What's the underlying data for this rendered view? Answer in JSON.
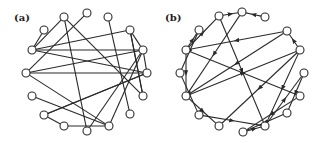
{
  "figure": {
    "panels": [
      {
        "id": "a",
        "label": "(a)",
        "label_pos": [
          14,
          21
        ],
        "directed": false,
        "node_radius": 4,
        "nodes": [
          [
            64,
            17
          ],
          [
            87,
            13
          ],
          [
            108,
            17
          ],
          [
            44,
            30
          ],
          [
            130,
            30
          ],
          [
            32,
            50
          ],
          [
            143,
            50
          ],
          [
            26,
            73
          ],
          [
            147,
            73
          ],
          [
            32,
            96
          ],
          [
            143,
            96
          ],
          [
            44,
            115
          ],
          [
            130,
            114
          ],
          [
            64,
            126
          ],
          [
            87,
            131
          ],
          [
            109,
            126
          ]
        ],
        "edges": [
          [
            0,
            5
          ],
          [
            0,
            14
          ],
          [
            0,
            10
          ],
          [
            3,
            5
          ],
          [
            2,
            12
          ],
          [
            5,
            4
          ],
          [
            5,
            6
          ],
          [
            5,
            8
          ],
          [
            7,
            1
          ],
          [
            7,
            6
          ],
          [
            7,
            8
          ],
          [
            7,
            15
          ],
          [
            4,
            6
          ],
          [
            4,
            10
          ],
          [
            6,
            8
          ],
          [
            6,
            15
          ],
          [
            8,
            11
          ],
          [
            9,
            15
          ],
          [
            11,
            13
          ],
          [
            11,
            8
          ],
          [
            13,
            15
          ],
          [
            14,
            6
          ],
          [
            10,
            4
          ]
        ]
      },
      {
        "id": "b",
        "label": "(b)",
        "label_pos": [
          165,
          21
        ],
        "directed": true,
        "node_radius": 4,
        "nodes": [
          [
            219,
            16
          ],
          [
            242,
            12
          ],
          [
            265,
            17
          ],
          [
            199,
            30
          ],
          [
            287,
            31
          ],
          [
            186,
            50
          ],
          [
            300,
            50
          ],
          [
            180,
            73
          ],
          [
            304,
            73
          ],
          [
            186,
            96
          ],
          [
            300,
            96
          ],
          [
            199,
            115
          ],
          [
            287,
            113
          ],
          [
            219,
            126
          ],
          [
            265,
            126
          ],
          [
            243,
            132
          ]
        ],
        "edges": [
          [
            2,
            1
          ],
          [
            0,
            1
          ],
          [
            5,
            0
          ],
          [
            1,
            9
          ],
          [
            4,
            5
          ],
          [
            6,
            4
          ],
          [
            5,
            10
          ],
          [
            5,
            3
          ],
          [
            5,
            9
          ],
          [
            0,
            14
          ],
          [
            7,
            11
          ],
          [
            9,
            13
          ],
          [
            11,
            14
          ],
          [
            6,
            13
          ],
          [
            4,
            9
          ],
          [
            14,
            8
          ],
          [
            12,
            15
          ],
          [
            15,
            14
          ],
          [
            8,
            12
          ],
          [
            6,
            14
          ],
          [
            3,
            7
          ],
          [
            9,
            6
          ],
          [
            10,
            15
          ]
        ]
      }
    ]
  }
}
